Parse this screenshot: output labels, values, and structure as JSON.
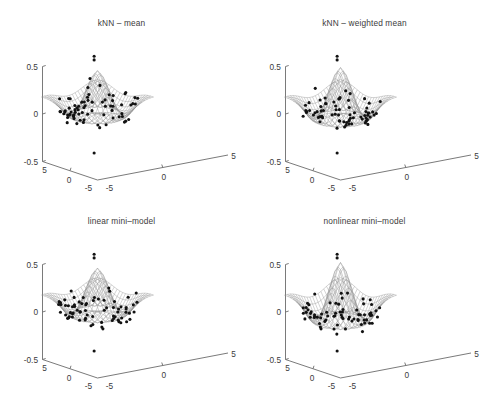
{
  "figure": {
    "background": "#ffffff",
    "axis_color": "#6b6b6b",
    "mesh_color": "#8d8d8d",
    "point_color": "#121212",
    "text_color": "#3b3b3b",
    "rows": 2,
    "cols": 2
  },
  "panels": [
    {
      "id": "knn-mean",
      "title": "kNN – mean",
      "peak_scale": 0.88,
      "sharpness": 1.0,
      "noise_seed": 11
    },
    {
      "id": "knn-weighted-mean",
      "title": "kNN – weighted mean",
      "peak_scale": 1.0,
      "sharpness": 1.12,
      "noise_seed": 23
    },
    {
      "id": "linear-mini-model",
      "title": "linear mini–model",
      "peak_scale": 0.9,
      "sharpness": 1.05,
      "noise_seed": 37
    },
    {
      "id": "nonlinear-mini-model",
      "title": "nonlinear mini–model",
      "peak_scale": 1.12,
      "sharpness": 1.45,
      "noise_seed": 51
    }
  ],
  "axes": {
    "z": {
      "label_top": "0.5",
      "label_mid": "0",
      "label_bottom": "-0.5",
      "ticks": [
        -0.5,
        0,
        0.5
      ],
      "min": -0.5,
      "max": 0.5
    },
    "x": {
      "label_near": "5",
      "label_mid": "0",
      "label_far": "-5",
      "ticks": [
        5,
        0,
        -5
      ],
      "min": -5,
      "max": 5
    },
    "y": {
      "label_near": "-5",
      "label_mid": "0",
      "label_far": "5",
      "ticks": [
        -5,
        0,
        5
      ],
      "min": -5,
      "max": 5
    }
  },
  "chart_data": {
    "type": "scatter",
    "plot_kind": "3d-mesh-surface-with-scatter",
    "title": "",
    "xlabel": "x",
    "ylabel": "y",
    "zlabel": "z",
    "xlim": [
      -5,
      5
    ],
    "ylim": [
      -5,
      5
    ],
    "zlim": [
      -0.5,
      0.5
    ],
    "xticks": [
      5,
      0,
      -5
    ],
    "yticks": [
      -5,
      0,
      5
    ],
    "zticks": [
      -0.5,
      0,
      0.5
    ],
    "grid": false,
    "legend": "none",
    "mesh_resolution": [
      21,
      21
    ],
    "subplot_titles": [
      "kNN – mean",
      "kNN – weighted mean",
      "linear mini–model",
      "nonlinear mini–model"
    ],
    "surface_description": "Radial wave surface: central positive peak near z=0.25 surrounded by an annular trough near z=-0.2, flattening to z~0 toward the edges; each of the four panels shows the same underlying function estimated by a different smoother.",
    "series": [
      {
        "name": "kNN – mean",
        "surface_peak_z": 0.25,
        "surface_trough_z": -0.2,
        "n_scatter_points": 72,
        "scatter_z_range": [
          -0.52,
          0.42
        ]
      },
      {
        "name": "kNN – weighted mean",
        "surface_peak_z": 0.28,
        "surface_trough_z": -0.22,
        "n_scatter_points": 72,
        "scatter_z_range": [
          -0.52,
          0.42
        ]
      },
      {
        "name": "linear mini–model",
        "surface_peak_z": 0.26,
        "surface_trough_z": -0.21,
        "n_scatter_points": 72,
        "scatter_z_range": [
          -0.52,
          0.42
        ]
      },
      {
        "name": "nonlinear mini–model",
        "surface_peak_z": 0.32,
        "surface_trough_z": -0.26,
        "n_scatter_points": 72,
        "scatter_z_range": [
          -0.52,
          0.42
        ]
      }
    ]
  }
}
